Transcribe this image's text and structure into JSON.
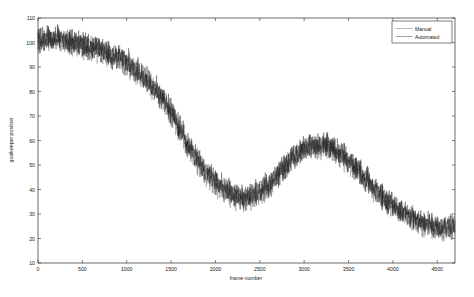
{
  "figure": {
    "background_color": "#ffffff",
    "axis_color": "#2b2b2b"
  },
  "chart_data": {
    "type": "line",
    "title": "",
    "xlabel": "frame number",
    "ylabel": "goalkeeper position",
    "xlim": [
      0,
      4700
    ],
    "ylim": [
      10,
      110
    ],
    "grid": false,
    "legend_position": "top-right",
    "xticks": [
      0,
      500,
      1000,
      1500,
      2000,
      2500,
      3000,
      3500,
      4000,
      4500
    ],
    "yticks": [
      10,
      20,
      30,
      40,
      50,
      60,
      70,
      80,
      90,
      100,
      110
    ],
    "noise_amplitude": 4.2,
    "series": [
      {
        "name": "Manual",
        "color": "#5f5f5f",
        "x": [
          0,
          100,
          200,
          300,
          400,
          500,
          600,
          700,
          800,
          900,
          1000,
          1100,
          1200,
          1300,
          1400,
          1500,
          1600,
          1700,
          1800,
          1900,
          2000,
          2100,
          2200,
          2300,
          2400,
          2500,
          2600,
          2700,
          2800,
          2900,
          3000,
          3100,
          3200,
          3300,
          3400,
          3500,
          3600,
          3700,
          3800,
          3900,
          4000,
          4100,
          4200,
          4300,
          4400,
          4500,
          4600,
          4700
        ],
        "values": [
          100,
          101,
          101,
          100,
          99,
          98,
          97,
          96,
          95,
          93,
          91,
          88,
          85,
          81,
          77,
          71,
          64,
          57,
          51,
          46,
          42,
          39,
          37,
          36,
          36,
          38,
          41,
          45,
          49,
          53,
          56,
          57,
          57,
          56,
          54,
          51,
          47,
          43,
          39,
          36,
          33,
          30,
          28,
          26,
          25,
          24,
          24,
          24
        ]
      },
      {
        "name": "Automated",
        "color": "#232323",
        "x": [
          0,
          100,
          200,
          300,
          400,
          500,
          600,
          700,
          800,
          900,
          1000,
          1100,
          1200,
          1300,
          1400,
          1500,
          1600,
          1700,
          1800,
          1900,
          2000,
          2100,
          2200,
          2300,
          2400,
          2500,
          2600,
          2700,
          2800,
          2900,
          3000,
          3100,
          3200,
          3300,
          3400,
          3500,
          3600,
          3700,
          3800,
          3900,
          4000,
          4100,
          4200,
          4300,
          4400,
          4500,
          4600,
          4700
        ],
        "values": [
          101,
          102,
          102,
          101,
          100,
          99,
          98,
          97,
          95,
          94,
          92,
          89,
          86,
          82,
          78,
          72,
          65,
          58,
          52,
          47,
          43,
          40,
          38,
          37,
          37,
          39,
          42,
          46,
          50,
          54,
          57,
          58,
          58,
          57,
          55,
          52,
          48,
          44,
          40,
          37,
          34,
          31,
          29,
          27,
          26,
          25,
          25,
          25
        ]
      }
    ]
  },
  "legend": {
    "entries": [
      {
        "label": "Manual"
      },
      {
        "label": "Automated"
      }
    ]
  }
}
